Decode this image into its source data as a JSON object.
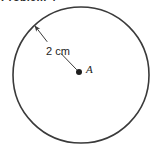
{
  "figure": {
    "kind": "circle-radius-diagram",
    "heading_fragment": "Problem 4",
    "background_color": "#ffffff",
    "stroke_color": "#3a3a3a",
    "text_color": "#1d1d1d",
    "circle": {
      "center_x": 81,
      "center_y": 75,
      "radius_px": 68,
      "stroke_width": 1.6
    },
    "center_point": {
      "label": "A",
      "x": 79,
      "y": 72,
      "dot_radius_px": 3
    },
    "radius_arrow": {
      "label": "2 cm",
      "from_x": 79,
      "from_y": 72,
      "to_x": 33,
      "to_y": 24,
      "arrowhead_at": "circle-edge",
      "stroke_width": 1.0
    },
    "measurement": {
      "value": 2,
      "unit": "cm",
      "quantity": "radius"
    }
  }
}
